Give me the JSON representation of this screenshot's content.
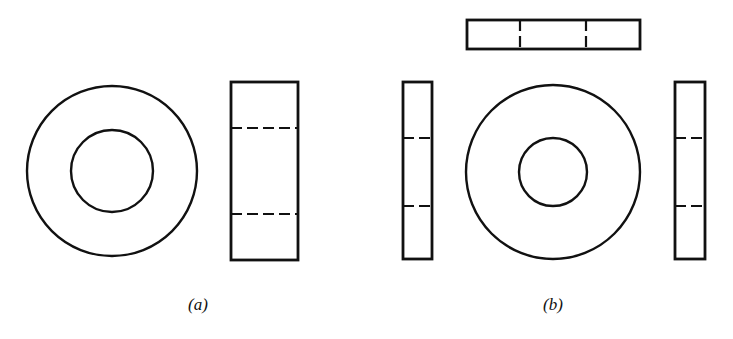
{
  "figure": {
    "stroke_color": "#111111",
    "background_color": "#ffffff",
    "panels": [
      {
        "id": "a",
        "caption": "(a)",
        "caption_pos": [
          198,
          295
        ],
        "views": [
          {
            "type": "front-view-washer",
            "outer_circle": {
              "cx": 112,
              "cy": 171,
              "r": 85
            },
            "inner_circle": {
              "cx": 112,
              "cy": 171,
              "r": 41
            }
          },
          {
            "type": "side-view",
            "rect": {
              "x": 231,
              "y": 82,
              "w": 67,
              "h": 178
            },
            "hidden_lines": [
              {
                "x1": 231,
                "y1": 128,
                "x2": 298,
                "y2": 128
              },
              {
                "x1": 231,
                "y1": 214,
                "x2": 298,
                "y2": 214
              }
            ]
          }
        ]
      },
      {
        "id": "b",
        "caption": "(b)",
        "caption_pos": [
          553,
          295
        ],
        "views": [
          {
            "type": "top-view",
            "rect": {
              "x": 467,
              "y": 20,
              "w": 173,
              "h": 29
            },
            "hidden_lines": [
              {
                "x1": 520,
                "y1": 20,
                "x2": 520,
                "y2": 49
              },
              {
                "x1": 586,
                "y1": 20,
                "x2": 586,
                "y2": 49
              }
            ]
          },
          {
            "type": "left-side-view",
            "rect": {
              "x": 403,
              "y": 82,
              "w": 29,
              "h": 177
            },
            "hidden_lines": [
              {
                "x1": 403,
                "y1": 138,
                "x2": 432,
                "y2": 138
              },
              {
                "x1": 403,
                "y1": 206,
                "x2": 432,
                "y2": 206
              }
            ]
          },
          {
            "type": "front-view-washer",
            "outer_circle": {
              "cx": 553,
              "cy": 172,
              "r": 87
            },
            "inner_circle": {
              "cx": 553,
              "cy": 172,
              "r": 34
            }
          },
          {
            "type": "right-side-view",
            "rect": {
              "x": 675,
              "y": 82,
              "w": 30,
              "h": 177
            },
            "hidden_lines": [
              {
                "x1": 675,
                "y1": 138,
                "x2": 705,
                "y2": 138
              },
              {
                "x1": 675,
                "y1": 206,
                "x2": 705,
                "y2": 206
              }
            ]
          }
        ]
      }
    ]
  }
}
